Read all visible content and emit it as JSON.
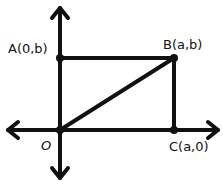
{
  "diagram": {
    "type": "coordinate-geometry-rectangle",
    "colors": {
      "ink": "#111111",
      "background": "#ffffff"
    },
    "points": {
      "A": {
        "label": "A(0,b)"
      },
      "B": {
        "label": "B(a,b)"
      },
      "C": {
        "label": "C(a,0)"
      },
      "O": {
        "label": "O"
      }
    },
    "edges": [
      "O-A",
      "A-B",
      "B-C",
      "C-O",
      "O-B"
    ],
    "axes": [
      "x-axis (bidirectional arrow)",
      "y-axis (bidirectional arrow)"
    ]
  }
}
